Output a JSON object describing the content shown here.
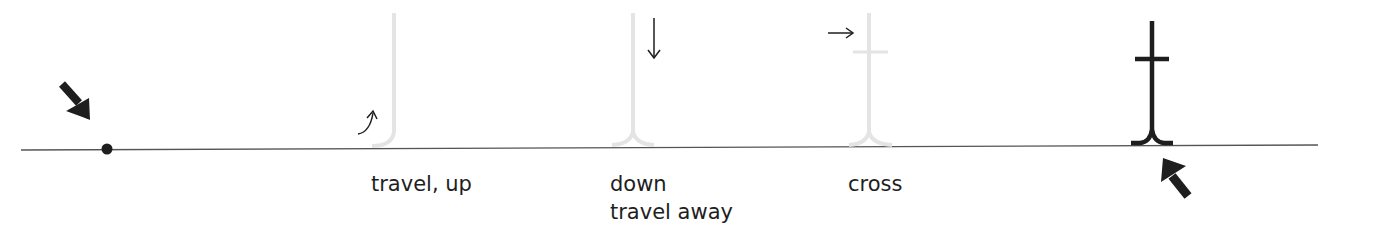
{
  "diagram": {
    "colors": {
      "ink": "#1e1e1e",
      "ghost_stroke": "#e4e4e4",
      "baseline": "#555555",
      "background": "#ffffff"
    },
    "baseline": {
      "x1": 21,
      "x2": 1318,
      "y_left": 150,
      "y_right": 145
    },
    "steps": [
      {
        "id": "start",
        "label": "",
        "marker": "start-dot",
        "pointer": "bold-arrow-down-right"
      },
      {
        "id": "step-1",
        "label": "travel, up",
        "direction_hint": "curved-arrow-up"
      },
      {
        "id": "step-2",
        "label_lines": [
          "down",
          "travel away"
        ],
        "direction_hint": "arrow-down"
      },
      {
        "id": "step-3",
        "label": "cross",
        "direction_hint": "arrow-right"
      },
      {
        "id": "finish",
        "label": "",
        "glyph": "completed-letter",
        "pointer": "bold-arrow-up-left"
      }
    ]
  }
}
